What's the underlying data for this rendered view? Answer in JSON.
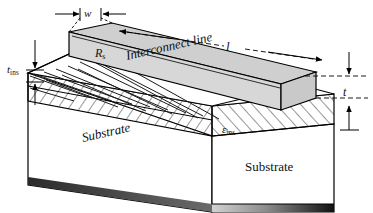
{
  "figure": {
    "dimensions": {
      "width_label": "w",
      "length_label": "l",
      "thickness_label": "t",
      "insulator_thickness_symbol": "t",
      "insulator_thickness_subscript": "ins"
    },
    "annotations": {
      "sheet_resistance_symbol": "R",
      "sheet_resistance_subscript": "s",
      "permittivity_symbol": "ε",
      "permittivity_subscript": "ins",
      "interconnect_label": "Interconnect line",
      "substrate_label_left": "Substrate",
      "substrate_label_front": "Substrate"
    },
    "colors": {
      "metal_fill": "#d7d7d7",
      "metal_top_fill": "#cfcfcf",
      "metal_end_fill": "#c9c9c9",
      "insulator_fill": "#ffffff",
      "substrate_fill": "#ffffff",
      "hatch_stroke": "#1a1a1a",
      "outline": "#000000",
      "base_shadow_dark": "#111111",
      "base_shadow_light": "#cfcfcf",
      "background": "#ffffff"
    }
  }
}
